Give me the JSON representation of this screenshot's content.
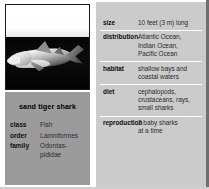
{
  "figure": {
    "kind": "species-fact-box",
    "photo": {
      "icon": "shark-photograph",
      "subject": "sand tiger shark swimming in dark water"
    }
  },
  "left_panel": {
    "species_name": "sand tiger shark",
    "taxonomy": [
      {
        "label": "class",
        "value": [
          "Fish"
        ]
      },
      {
        "label": "order",
        "value": [
          "Lamniformes"
        ]
      },
      {
        "label": "family",
        "value": [
          "Odontas-",
          "pididae"
        ]
      }
    ]
  },
  "right_panel": {
    "facts": [
      {
        "label": "size",
        "value": [
          "10 feet (3 m) long"
        ]
      },
      {
        "label": "distribution",
        "value": [
          "Atlantic Ocean,",
          "Indian Ocean,",
          "Pacific Ocean"
        ]
      },
      {
        "label": "habitat",
        "value": [
          "shallow bays and",
          "coastal waters"
        ]
      },
      {
        "label": "diet",
        "value": [
          "cephalopods,",
          "crustaceans, rays,",
          "small sharks"
        ]
      },
      {
        "label": "reproduction",
        "value": [
          "2 baby sharks",
          "at a time"
        ]
      }
    ]
  },
  "colors": {
    "page_background": "#c9c9c9",
    "left_table_background": "#9b9b9b",
    "right_panel_background": "#cbcbcb",
    "photo_water": "#0a0a0a",
    "photo_sky": "#ffffff",
    "rule": "#ffffff",
    "frame_right": "#6e6e6e",
    "text": "#000000"
  }
}
